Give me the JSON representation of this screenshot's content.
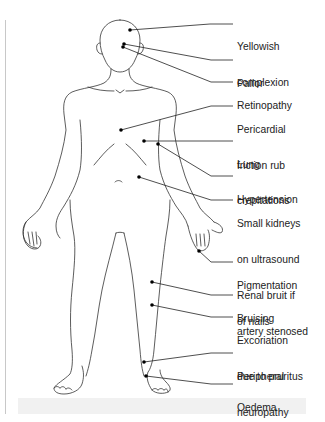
{
  "figure": {
    "colors": {
      "outline": "#333333",
      "leader": "#222222",
      "text": "#222222",
      "rule": "#c8c8c8",
      "band": "#f1f1f1"
    },
    "annotations": [
      {
        "id": "yellowish-complexion",
        "lines": [
          "Yellowish",
          "complexion"
        ],
        "top": 17,
        "dot": [
          130,
          30
        ],
        "elbow": [
          210,
          24
        ],
        "end": [
          233,
          24
        ]
      },
      {
        "id": "pallor",
        "lines": [
          "Pallor"
        ],
        "top": 54,
        "dot": [
          124,
          44
        ],
        "elbow": [
          211,
          60
        ],
        "end": [
          233,
          60
        ]
      },
      {
        "id": "retinopathy",
        "lines": [
          "Retinopathy"
        ],
        "top": 76,
        "dot": [
          123,
          47
        ],
        "elbow": [
          211,
          82
        ],
        "end": [
          233,
          82
        ]
      },
      {
        "id": "pericardial-friction-rub",
        "lines": [
          "Pericardial",
          "friction rub"
        ],
        "top": 100,
        "dot": [
          121,
          130
        ],
        "elbow": [
          211,
          106
        ],
        "end": [
          233,
          106
        ]
      },
      {
        "id": "lung-crepitations",
        "lines": [
          "Lung",
          "crepitations"
        ],
        "top": 135,
        "dot": [
          144,
          141
        ],
        "elbow": [
          211,
          141
        ],
        "end": [
          233,
          141
        ]
      },
      {
        "id": "hypertension",
        "lines": [
          "Hypertension"
        ],
        "top": 170,
        "dot": [
          158,
          144
        ],
        "elbow": [
          211,
          176
        ],
        "end": [
          233,
          176
        ]
      },
      {
        "id": "small-kidneys",
        "lines": [
          "Small kidneys",
          "on ultrasound",
          "Renal bruit if",
          "artery stenosed"
        ],
        "top": 194,
        "dot": [
          139,
          177
        ],
        "elbow": [
          211,
          200
        ],
        "end": [
          233,
          200
        ]
      },
      {
        "id": "pigmentation-of-nails",
        "lines": [
          "Pigmentation",
          "of nails"
        ],
        "top": 256,
        "dot": [
          199,
          251
        ],
        "elbow": [
          211,
          262
        ],
        "end": [
          233,
          262
        ]
      },
      {
        "id": "bruising",
        "lines": [
          "Bruising"
        ],
        "top": 289,
        "dot": [
          152,
          282
        ],
        "elbow": [
          211,
          295
        ],
        "end": [
          233,
          295
        ]
      },
      {
        "id": "excoriation",
        "lines": [
          "Excoriation",
          "due to pruritus"
        ],
        "top": 311,
        "dot": [
          152,
          305
        ],
        "elbow": [
          211,
          317
        ],
        "end": [
          233,
          317
        ]
      },
      {
        "id": "peripheral-neuropathy",
        "lines": [
          "Peripheral",
          "neuropathy"
        ],
        "top": 347,
        "dot": [
          144,
          362
        ],
        "elbow": [
          211,
          353
        ],
        "end": [
          233,
          353
        ]
      },
      {
        "id": "oedema",
        "lines": [
          "Oedema"
        ],
        "top": 378,
        "dot": [
          146,
          376
        ],
        "elbow": [
          211,
          384
        ],
        "end": [
          233,
          384
        ]
      }
    ]
  },
  "labels": {
    "yellowish": [
      "Yellowish",
      "complexion"
    ],
    "pallor": [
      "Pallor"
    ],
    "retinopathy": [
      "Retinopathy"
    ],
    "pericardial": [
      "Pericardial",
      "friction rub"
    ],
    "lung": [
      "Lung",
      "crepitations"
    ],
    "hypertension": [
      "Hypertension"
    ],
    "kidneys": [
      "Small kidneys",
      "on ultrasound",
      "Renal bruit if",
      "artery stenosed"
    ],
    "pigmentation": [
      "Pigmentation",
      "of nails"
    ],
    "bruising": [
      "Bruising"
    ],
    "excoriation": [
      "Excoriation",
      "due to pruritus"
    ],
    "peripheral": [
      "Peripheral",
      "neuropathy"
    ],
    "oedema": [
      "Oedema"
    ]
  }
}
